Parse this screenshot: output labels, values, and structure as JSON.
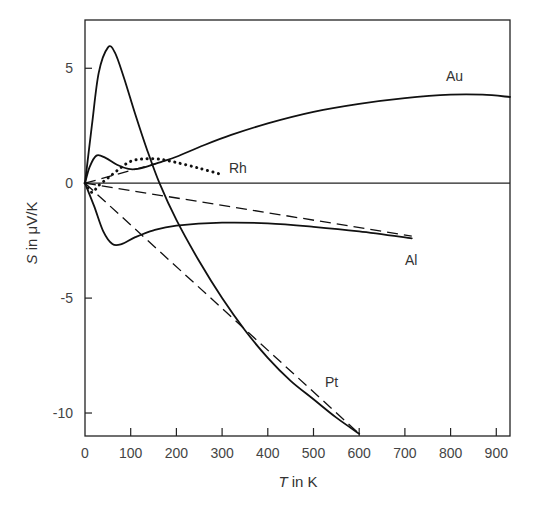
{
  "chart_data": {
    "type": "line",
    "title": "",
    "xlabel": "T in K",
    "xlabel_var": "T",
    "xlabel_rest": " in K",
    "ylabel": "S in μV/K",
    "ylabel_var": "S",
    "ylabel_rest": " in μV/K",
    "xlim": [
      0,
      930
    ],
    "ylim": [
      -11,
      7.1
    ],
    "x_ticks": [
      0,
      100,
      200,
      300,
      400,
      500,
      600,
      700,
      800,
      900
    ],
    "y_ticks": [
      5,
      0,
      -5,
      -10
    ],
    "grid": false,
    "legend": "inline labels",
    "zero_line": true,
    "series": [
      {
        "name": "Au",
        "style": "solid",
        "label_pos": [
          790,
          4.45
        ],
        "points": [
          [
            0,
            0
          ],
          [
            10,
            0.7
          ],
          [
            25,
            1.2
          ],
          [
            45,
            1.1
          ],
          [
            70,
            0.8
          ],
          [
            95,
            0.62
          ],
          [
            115,
            0.62
          ],
          [
            140,
            0.75
          ],
          [
            170,
            0.95
          ],
          [
            200,
            1.15
          ],
          [
            260,
            1.65
          ],
          [
            320,
            2.1
          ],
          [
            400,
            2.6
          ],
          [
            500,
            3.1
          ],
          [
            600,
            3.45
          ],
          [
            700,
            3.7
          ],
          [
            800,
            3.85
          ],
          [
            870,
            3.85
          ],
          [
            930,
            3.75
          ]
        ]
      },
      {
        "name": "Au (linear approx.)",
        "style": "dashed",
        "points": [
          [
            0,
            0
          ],
          [
            155,
            0.85
          ]
        ]
      },
      {
        "name": "Rh",
        "style": "dotted",
        "label_pos": [
          315,
          0.45
        ],
        "points": [
          [
            0,
            0
          ],
          [
            15,
            -0.4
          ],
          [
            30,
            -0.1
          ],
          [
            55,
            0.3
          ],
          [
            80,
            0.7
          ],
          [
            100,
            0.95
          ],
          [
            125,
            1.05
          ],
          [
            160,
            1.05
          ],
          [
            200,
            0.9
          ],
          [
            250,
            0.65
          ],
          [
            295,
            0.4
          ]
        ]
      },
      {
        "name": "Pt",
        "style": "solid",
        "label_pos": [
          525,
          -8.85
        ],
        "points": [
          [
            0,
            0
          ],
          [
            15,
            2.5
          ],
          [
            30,
            4.8
          ],
          [
            50,
            5.9
          ],
          [
            65,
            5.7
          ],
          [
            85,
            4.6
          ],
          [
            110,
            3.0
          ],
          [
            135,
            1.5
          ],
          [
            163,
            0
          ],
          [
            200,
            -1.6
          ],
          [
            250,
            -3.4
          ],
          [
            300,
            -5.0
          ],
          [
            350,
            -6.4
          ],
          [
            400,
            -7.6
          ],
          [
            450,
            -8.6
          ],
          [
            500,
            -9.4
          ],
          [
            550,
            -10.2
          ],
          [
            600,
            -10.9
          ]
        ]
      },
      {
        "name": "Pt (linear approx.)",
        "style": "dashed",
        "points": [
          [
            0,
            0
          ],
          [
            600,
            -10.9
          ]
        ]
      },
      {
        "name": "Al",
        "style": "solid",
        "label_pos": [
          700,
          -3.55
        ],
        "points": [
          [
            0,
            0
          ],
          [
            20,
            -1.0
          ],
          [
            40,
            -2.1
          ],
          [
            60,
            -2.65
          ],
          [
            80,
            -2.65
          ],
          [
            110,
            -2.35
          ],
          [
            150,
            -2.05
          ],
          [
            200,
            -1.85
          ],
          [
            300,
            -1.72
          ],
          [
            400,
            -1.75
          ],
          [
            500,
            -1.9
          ],
          [
            600,
            -2.1
          ],
          [
            715,
            -2.4
          ]
        ]
      },
      {
        "name": "Al (linear approx.)",
        "style": "dashed",
        "points": [
          [
            0,
            0
          ],
          [
            715,
            -2.3
          ]
        ]
      }
    ]
  }
}
